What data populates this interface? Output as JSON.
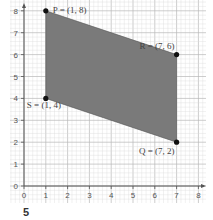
{
  "chart_data": {
    "type": "scatter",
    "title": "",
    "xlabel": "",
    "ylabel": "",
    "xlim": [
      0,
      8
    ],
    "ylim": [
      0,
      8
    ],
    "x_ticks": [
      "0",
      "1",
      "2",
      "3",
      "4",
      "5",
      "6",
      "7",
      "8"
    ],
    "y_ticks": [
      "0",
      "1",
      "2",
      "3",
      "4",
      "5",
      "6",
      "7",
      "8"
    ],
    "grid": true,
    "grid_minor_step": 0.2,
    "points": [
      {
        "name": "P",
        "x": 1,
        "y": 8,
        "label": "P = (1, 8)"
      },
      {
        "name": "R",
        "x": 7,
        "y": 6,
        "label": "R = (7, 6)"
      },
      {
        "name": "Q",
        "x": 7,
        "y": 2,
        "label": "Q = (7, 2)"
      },
      {
        "name": "S",
        "x": 1,
        "y": 4,
        "label": "S = (1, 4)"
      }
    ],
    "polygon": {
      "vertices": [
        "P",
        "R",
        "Q",
        "S"
      ],
      "fill": "#7a7a7a"
    }
  },
  "question_number": "5",
  "colors": {
    "grid_minor": "#dcdcdc",
    "grid_major": "#b8b8b8",
    "axis": "#555555",
    "shade": "#7a7a7a",
    "point": "#111111"
  }
}
